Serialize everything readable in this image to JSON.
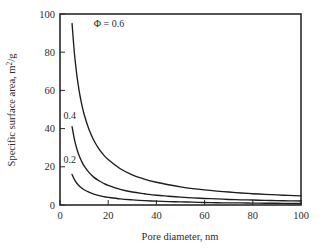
{
  "chart_data": {
    "type": "line",
    "title": "",
    "xlabel": "Pore diameter, nm",
    "ylabel": "Specific surface area, m²/g",
    "ylabel_main": "Specific surface area, m",
    "ylabel_sup": "2",
    "ylabel_tail": "/g",
    "xlim": [
      0,
      100
    ],
    "ylim": [
      0,
      100
    ],
    "xticks": [
      0,
      20,
      40,
      60,
      80,
      100
    ],
    "yticks": [
      0,
      20,
      40,
      60,
      80,
      100
    ],
    "xtick_labels": [
      "0",
      "20",
      "40",
      "60",
      "80",
      "100"
    ],
    "ytick_labels": [
      "0",
      "20",
      "40",
      "60",
      "80",
      "100"
    ],
    "grid": false,
    "legend": "inline-curve-labels",
    "x": [
      5,
      6,
      7,
      8,
      9,
      10,
      12,
      14,
      16,
      18,
      20,
      25,
      30,
      35,
      40,
      45,
      50,
      55,
      60,
      65,
      70,
      75,
      80,
      85,
      90,
      95,
      100
    ],
    "series": [
      {
        "name": "Φ = 0.6",
        "phi": 0.6,
        "label": "Φ = 0.6",
        "label_x": 14,
        "label_y": 93,
        "values": [
          95.0,
          79.2,
          67.9,
          59.4,
          52.8,
          47.5,
          39.6,
          33.9,
          29.7,
          26.4,
          23.8,
          19.0,
          15.8,
          13.6,
          11.9,
          10.6,
          9.5,
          8.6,
          7.9,
          7.3,
          6.8,
          6.3,
          5.9,
          5.6,
          5.3,
          5.0,
          4.8
        ]
      },
      {
        "name": "0.4",
        "phi": 0.4,
        "label": "0.4",
        "label_x": 1.5,
        "label_y": 45,
        "values": [
          41.0,
          34.2,
          29.3,
          25.6,
          22.8,
          20.5,
          17.1,
          14.6,
          12.8,
          11.4,
          10.3,
          8.2,
          6.8,
          5.9,
          5.1,
          4.6,
          4.1,
          3.7,
          3.4,
          3.2,
          2.9,
          2.7,
          2.6,
          2.4,
          2.3,
          2.2,
          2.1
        ]
      },
      {
        "name": "0.2",
        "phi": 0.2,
        "label": "0.2",
        "label_x": 1.5,
        "label_y": 22,
        "values": [
          16.0,
          13.3,
          11.4,
          10.0,
          8.9,
          8.0,
          6.7,
          5.7,
          5.0,
          4.4,
          4.0,
          3.2,
          2.7,
          2.3,
          2.0,
          1.8,
          1.6,
          1.5,
          1.3,
          1.2,
          1.1,
          1.1,
          1.0,
          0.9,
          0.9,
          0.8,
          0.8
        ]
      }
    ],
    "colors": {
      "curve": "#1d1d1d",
      "axis": "#2a2a2a",
      "text": "#2b2b2b",
      "background": "#ffffff"
    }
  }
}
